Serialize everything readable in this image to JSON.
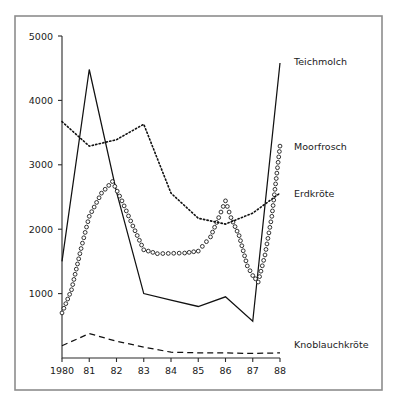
{
  "figure": {
    "background": "#ffffff",
    "frame_color": "#8d8d8d",
    "ink_color": "#111111"
  },
  "chart_data": {
    "type": "line",
    "title": "",
    "subtitle": "",
    "xlabel": "",
    "ylabel": "",
    "x": [
      1980,
      1981,
      1982,
      1983,
      1984,
      1985,
      1986,
      1987,
      1988
    ],
    "categories": [
      "1980",
      "81",
      "82",
      "83",
      "84",
      "85",
      "86",
      "87",
      "88"
    ],
    "xtick_labels": [
      "1980",
      "81",
      "82",
      "83",
      "84",
      "85",
      "86",
      "87",
      "88"
    ],
    "ytick_labels": [
      "1000",
      "2000",
      "3000",
      "4000",
      "5000"
    ],
    "yticks": [
      1000,
      2000,
      3000,
      4000,
      5000
    ],
    "ylim": [
      0,
      5000
    ],
    "xlim": [
      1980,
      1988
    ],
    "grid": false,
    "legend_position": "right-inline-labels",
    "series": [
      {
        "name": "Teichmolch",
        "style": "solid",
        "marker": "none",
        "label_x": 1988.15,
        "label_y": 4600,
        "x": [
          1980,
          1981,
          1982,
          1983,
          1984,
          1985,
          1986,
          1987,
          1988
        ],
        "values": [
          1500,
          4480,
          2580,
          1000,
          900,
          800,
          950,
          570,
          4580
        ]
      },
      {
        "name": "Moorfrosch",
        "style": "none",
        "marker": "open-circle",
        "label_x": 1988.15,
        "label_y": 3280,
        "x": [
          1980,
          1981,
          1982,
          1983,
          1984,
          1985,
          1986,
          1987,
          1988
        ],
        "values": [
          700,
          2450,
          2740,
          1900,
          1620,
          1700,
          2440,
          1180,
          3290
        ],
        "waypoints": [
          [
            1980.0,
            700
          ],
          [
            1980.35,
            1060
          ],
          [
            1980.7,
            1700
          ],
          [
            1981.0,
            2200
          ],
          [
            1981.45,
            2560
          ],
          [
            1981.85,
            2740
          ],
          [
            1982.2,
            2440
          ],
          [
            1982.6,
            2050
          ],
          [
            1983.0,
            1680
          ],
          [
            1983.5,
            1620
          ],
          [
            1984.5,
            1630
          ],
          [
            1985.0,
            1660
          ],
          [
            1985.45,
            1880
          ],
          [
            1985.75,
            2180
          ],
          [
            1986.0,
            2440
          ],
          [
            1986.2,
            2180
          ],
          [
            1986.5,
            1900
          ],
          [
            1986.8,
            1430
          ],
          [
            1987.0,
            1280
          ],
          [
            1987.2,
            1180
          ],
          [
            1987.45,
            1600
          ],
          [
            1987.7,
            2200
          ],
          [
            1988.0,
            3290
          ]
        ]
      },
      {
        "name": "Erdkröte",
        "style": "fine-dotted",
        "marker": "none",
        "label_x": 1988.15,
        "label_y": 2560,
        "x": [
          1980,
          1981,
          1982,
          1983,
          1984,
          1985,
          1986,
          1987,
          1988
        ],
        "values": [
          3670,
          3290,
          3390,
          3630,
          2560,
          2170,
          2080,
          2250,
          2560
        ]
      },
      {
        "name": "Knoblauchkröte",
        "style": "dashed",
        "marker": "none",
        "label_x": 1988.15,
        "label_y": 210,
        "x": [
          1980,
          1981,
          1982,
          1983,
          1984,
          1985,
          1986,
          1987,
          1988
        ],
        "values": [
          190,
          380,
          260,
          170,
          90,
          80,
          80,
          70,
          80
        ]
      }
    ]
  }
}
